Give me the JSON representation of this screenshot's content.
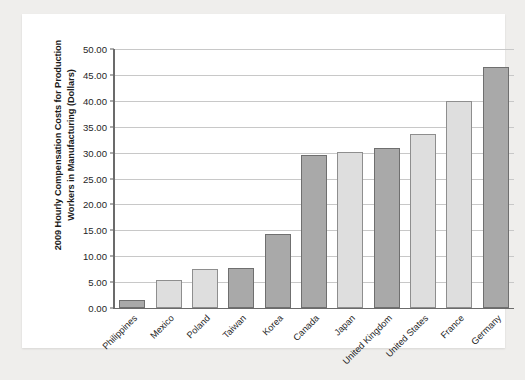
{
  "chart_data": {
    "type": "bar",
    "title": "",
    "xlabel": "",
    "ylabel": "2009 Hourly Compensation Costs for Production Workers in Manufacturing (Dollars)",
    "ylabel_lines": [
      "2009 Hourly Compensation Costs for Production",
      "Workers in Manufacturing (Dollars)"
    ],
    "categories": [
      "Philippines",
      "Mexico",
      "Poland",
      "Taiwan",
      "Korea",
      "Canada",
      "Japan",
      "United Kingdom",
      "United States",
      "France",
      "Germany"
    ],
    "values": [
      1.5,
      5.5,
      7.5,
      7.8,
      14.2,
      29.5,
      30.1,
      30.8,
      33.6,
      40.0,
      46.5
    ],
    "bar_shades": [
      "dark",
      "light",
      "light",
      "dark",
      "dark",
      "dark",
      "light",
      "dark",
      "light",
      "light",
      "dark"
    ],
    "ylim": [
      0,
      50
    ],
    "ytick_labels": [
      "50.00",
      "45.00",
      "40.00",
      "35.00",
      "30.00",
      "25.00",
      "20.00",
      "15.00",
      "10.00",
      "5.00",
      "0.00"
    ],
    "ytick_values": [
      50,
      45,
      40,
      35,
      30,
      25,
      20,
      15,
      10,
      5,
      0
    ],
    "grid": true,
    "legend": "none",
    "colors": {
      "bar_dark": "#a9a9a9",
      "bar_light": "#dedede",
      "gridline": "#c8c8c8",
      "axis": "#6b6b6b",
      "panel_background": "#ffffff",
      "page_background": "#efeeec",
      "text": "#1f1f1f"
    }
  }
}
